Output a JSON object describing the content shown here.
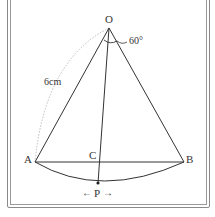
{
  "diagram": {
    "type": "sector",
    "labels": {
      "O": "O",
      "A": "A",
      "B": "B",
      "C": "C",
      "P": "P",
      "angle": "60°",
      "radius": "6cm",
      "left_arrow": "←",
      "right_arrow": "→"
    },
    "points": {
      "O": [
        109,
        28
      ],
      "A": [
        35,
        162
      ],
      "B": [
        184,
        162
      ],
      "C": [
        100,
        162
      ],
      "P": [
        98,
        183
      ]
    },
    "colors": {
      "line": "#333333",
      "dotted": "#aaaaaa",
      "frame": "#8a8a8a"
    }
  }
}
